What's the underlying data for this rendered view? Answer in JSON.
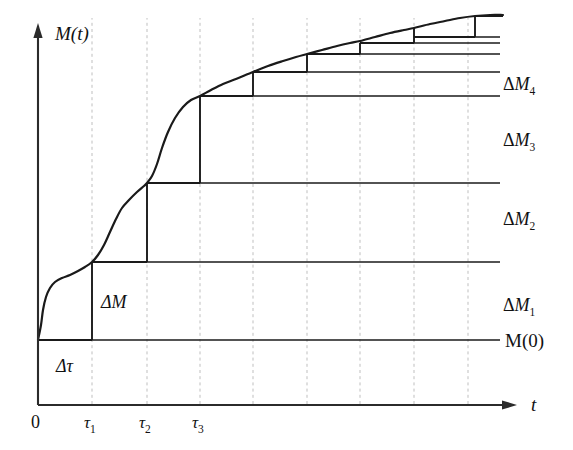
{
  "figure": {
    "domain": "Chart",
    "background_color": "#ffffff",
    "ink_color": "#1a1a1a",
    "grid_color": "#bfbfbf"
  },
  "axes": {
    "y_axis_label": "M(t)",
    "x_axis_label": "t",
    "origin_label": "0",
    "x_tick_labels": [
      {
        "base": "τ",
        "sub": "1"
      },
      {
        "base": "τ",
        "sub": "2"
      },
      {
        "base": "τ",
        "sub": "3"
      }
    ]
  },
  "annotations": {
    "baseline_label": "M(0)",
    "delta_tau_label": "Δτ",
    "delta_m_label": "ΔM",
    "increment_labels": [
      {
        "base": "ΔM",
        "sub": "1"
      },
      {
        "base": "ΔM",
        "sub": "2"
      },
      {
        "base": "ΔM",
        "sub": "3"
      },
      {
        "base": "ΔM",
        "sub": "4"
      }
    ]
  },
  "chart_data": {
    "type": "line",
    "title": "",
    "xlabel": "t",
    "ylabel": "M(t)",
    "grid": "vertical-dashed",
    "legend": "none",
    "axis_pixel_frame": {
      "x_axis_y": 405,
      "y_axis_x": 38,
      "x_axis_x_start": 38,
      "x_axis_x_end": 512,
      "y_axis_y_top": 28,
      "baseline_y": 340
    },
    "x_gridline_positions": [
      92,
      147,
      200,
      253,
      307,
      360,
      414,
      468
    ],
    "x_tick_positions": [
      92,
      147,
      200
    ],
    "curve_points": [
      [
        38,
        340
      ],
      [
        41,
        325
      ],
      [
        43,
        310
      ],
      [
        46,
        297
      ],
      [
        50,
        288
      ],
      [
        55,
        282
      ],
      [
        62,
        278
      ],
      [
        70,
        275
      ],
      [
        78,
        271
      ],
      [
        85,
        267
      ],
      [
        92,
        262
      ],
      [
        98,
        255
      ],
      [
        104,
        245
      ],
      [
        110,
        232
      ],
      [
        116,
        219
      ],
      [
        122,
        208
      ],
      [
        129,
        200
      ],
      [
        137,
        192
      ],
      [
        144,
        186
      ],
      [
        147,
        183
      ],
      [
        152,
        176
      ],
      [
        157,
        164
      ],
      [
        162,
        148
      ],
      [
        168,
        132
      ],
      [
        175,
        118
      ],
      [
        183,
        107
      ],
      [
        191,
        100
      ],
      [
        200,
        96
      ],
      [
        211,
        90
      ],
      [
        223,
        84
      ],
      [
        236,
        79
      ],
      [
        248,
        74
      ],
      [
        253,
        72
      ],
      [
        268,
        66
      ],
      [
        283,
        61
      ],
      [
        296,
        57
      ],
      [
        307,
        54
      ],
      [
        322,
        50
      ],
      [
        337,
        46
      ],
      [
        350,
        43
      ],
      [
        360,
        41
      ],
      [
        375,
        37
      ],
      [
        390,
        33
      ],
      [
        404,
        30
      ],
      [
        414,
        28
      ],
      [
        430,
        24
      ],
      [
        445,
        21
      ],
      [
        460,
        18
      ],
      [
        475,
        16
      ],
      [
        490,
        15
      ],
      [
        503,
        15
      ]
    ],
    "staircase": {
      "risers": [
        {
          "x": 92,
          "y_from": 340,
          "y_to": 262,
          "label": "ΔM"
        },
        {
          "x": 147,
          "y_from": 262,
          "y_to": 183
        },
        {
          "x": 200,
          "y_from": 183,
          "y_to": 96
        },
        {
          "x": 253,
          "y_from": 96,
          "y_to": 72
        },
        {
          "x": 307,
          "y_from": 72,
          "y_to": 54
        },
        {
          "x": 360,
          "y_from": 54,
          "y_to": 43
        },
        {
          "x": 414,
          "y_from": 43,
          "y_to": 28
        },
        {
          "x": 475,
          "y_from": 37,
          "y_to": 16
        }
      ],
      "treads": [
        {
          "y": 340,
          "x_from": 38,
          "x_to": 92
        },
        {
          "y": 262,
          "x_from": 92,
          "x_to": 147
        },
        {
          "y": 183,
          "x_from": 147,
          "x_to": 200
        },
        {
          "y": 96,
          "x_from": 200,
          "x_to": 253
        },
        {
          "y": 72,
          "x_from": 253,
          "x_to": 307
        },
        {
          "y": 54,
          "x_from": 307,
          "x_to": 360
        },
        {
          "y": 43,
          "x_from": 360,
          "x_to": 414
        },
        {
          "y": 37,
          "x_from": 414,
          "x_to": 475
        },
        {
          "y": 16,
          "x_from": 475,
          "x_to": 503
        }
      ]
    },
    "level_lines": [
      {
        "name": "M(0)",
        "y": 340,
        "x_from": 38,
        "x_to": 500
      },
      {
        "name": "L1",
        "y": 262,
        "x_from": 92,
        "x_to": 500
      },
      {
        "name": "L2",
        "y": 183,
        "x_from": 147,
        "x_to": 500
      },
      {
        "name": "L3",
        "y": 96,
        "x_from": 200,
        "x_to": 500
      },
      {
        "name": "L4",
        "y": 72,
        "x_from": 253,
        "x_to": 500
      },
      {
        "name": "L5",
        "y": 54,
        "x_from": 307,
        "x_to": 500
      },
      {
        "name": "L6",
        "y": 43,
        "x_from": 360,
        "x_to": 500
      },
      {
        "name": "L7",
        "y": 37,
        "x_from": 414,
        "x_to": 500
      },
      {
        "name": "L8",
        "y": 16,
        "x_from": 475,
        "x_to": 503
      }
    ],
    "label_positions": {
      "y_axis_label": [
        55,
        40
      ],
      "x_axis_label": [
        531,
        411
      ],
      "origin": [
        31,
        428
      ],
      "tau1": [
        84,
        428
      ],
      "tau2": [
        139,
        428
      ],
      "tau3": [
        192,
        428
      ],
      "delta_tau": [
        56,
        372
      ],
      "delta_m": [
        101,
        308
      ],
      "dM1": [
        503,
        311
      ],
      "dM2": [
        503,
        225
      ],
      "dM3": [
        503,
        146
      ],
      "dM4": [
        503,
        90
      ],
      "M0": [
        505,
        347
      ]
    }
  }
}
